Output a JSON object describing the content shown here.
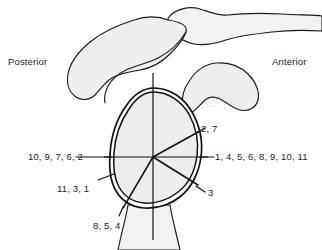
{
  "figure": {
    "orientation": {
      "posterior": "Posterior",
      "anterior": "Anterior"
    },
    "sector_labels": {
      "superior_anterior": "2, 7",
      "posterior": "10, 9, 7, 6, 2",
      "anterior": "1, 4, 5, 6, 8, 9, 10, 11",
      "posterior_inferior": "11, 3, 1",
      "anterior_inferior": "3",
      "inferior": "8, 5, 4"
    },
    "icons": {
      "scapular_spine": "bone-shape-icon",
      "acromion": "bone-shape-icon",
      "coracoid": "bone-shape-icon",
      "glenoid": "glenoid-oval-icon",
      "humeral_shaft": "bone-shape-icon",
      "cartilage_stipple": "stipple-texture-icon"
    },
    "colors": {
      "bone_fill": "#eeeeee",
      "glenoid_fill": "#ededed",
      "outline": "#111111",
      "stipple": "#9a9a9a",
      "background": "#ffffff"
    }
  }
}
